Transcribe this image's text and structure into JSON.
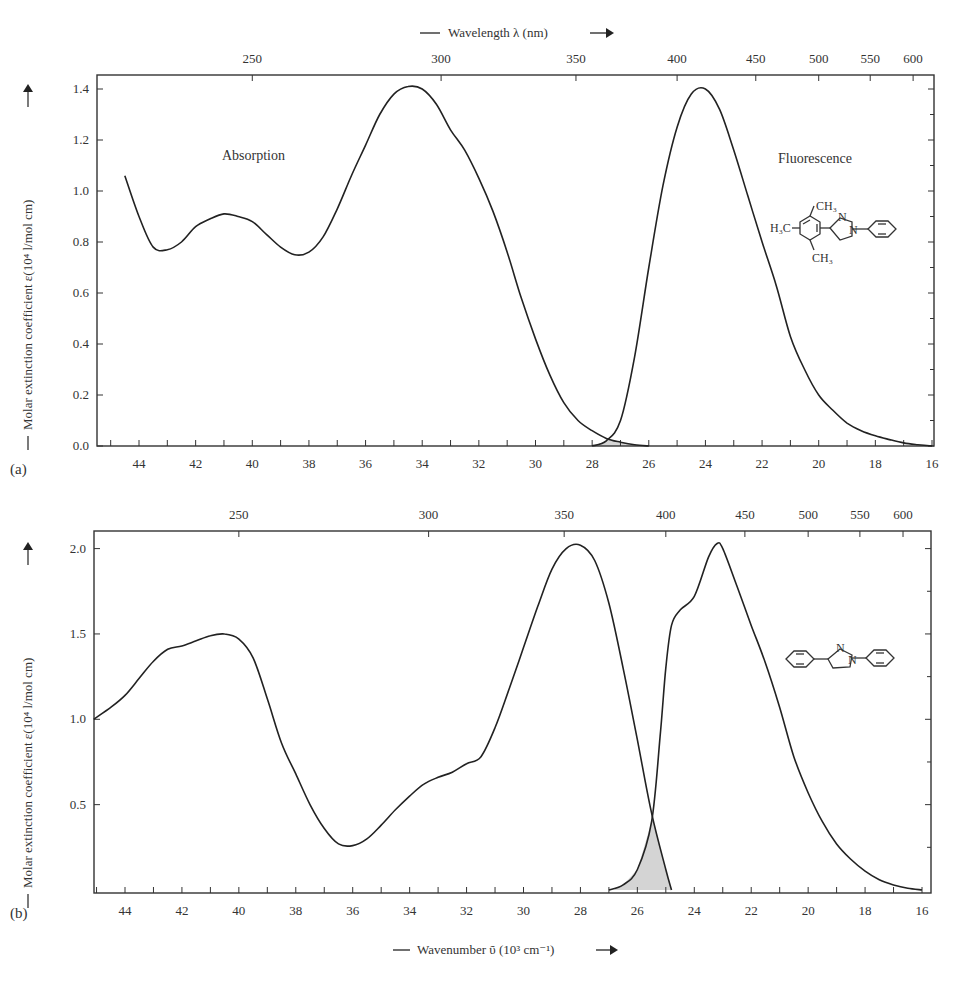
{
  "top_axis_title": "Wavelength λ (nm)",
  "bottom_axis_title": "Wavenumber ῦ (10³ cm⁻¹)",
  "y_axis_title": "Molar extinction coefficient ε(10⁴ l/mol cm)",
  "panels": {
    "a": {
      "label": "(a)",
      "absorption_label": "Absorption",
      "fluorescence_label": "Fluorescence",
      "molecule": {
        "substituents": [
          "CH₃",
          "H₃C",
          "CH₃"
        ],
        "atoms": [
          "N",
          "N"
        ]
      }
    },
    "b": {
      "label": "(b)",
      "molecule": {
        "atoms": [
          "N",
          "N"
        ]
      }
    }
  },
  "colors": {
    "curve": "#222222",
    "overlap_fill": "#d4d4d4",
    "frame": "#333333"
  },
  "chart_data": [
    {
      "type": "line",
      "title": "(a)",
      "xlabel": "Wavenumber ῦ (10³ cm⁻¹)",
      "x2label": "Wavelength λ (nm)",
      "ylabel": "Molar extinction coefficient ε(10⁴ l/mol cm)",
      "xlim": [
        45.5,
        15.9
      ],
      "ylim": [
        0,
        1.45
      ],
      "x_ticks": [
        44,
        42,
        40,
        38,
        36,
        34,
        32,
        30,
        28,
        26,
        24,
        22,
        20,
        18,
        16
      ],
      "y_ticks": [
        0.0,
        0.2,
        0.4,
        0.6,
        0.8,
        1.0,
        1.2,
        1.4
      ],
      "y_tick_labels": [
        "0.0",
        "0.2",
        "0.4",
        "0.6",
        "0.8",
        "1.0",
        "1.2",
        "1.4"
      ],
      "x2_ticks_nm": [
        250,
        300,
        350,
        400,
        450,
        500,
        550,
        600
      ],
      "grid": false,
      "annotations": [
        "Absorption",
        "Fluorescence"
      ],
      "series": [
        {
          "name": "Absorption",
          "x": [
            44.5,
            44.0,
            43.5,
            43.0,
            42.5,
            42.0,
            41.5,
            41.0,
            40.5,
            40.0,
            39.5,
            39.0,
            38.5,
            38.0,
            37.5,
            37.0,
            36.5,
            36.0,
            35.5,
            35.0,
            34.5,
            34.0,
            33.5,
            33.0,
            32.5,
            32.0,
            31.5,
            31.0,
            30.5,
            30.0,
            29.5,
            29.0,
            28.5,
            28.0,
            27.5,
            27.0,
            26.5,
            26.0
          ],
          "values": [
            1.06,
            0.9,
            0.78,
            0.77,
            0.8,
            0.86,
            0.89,
            0.91,
            0.9,
            0.88,
            0.83,
            0.78,
            0.75,
            0.76,
            0.82,
            0.93,
            1.06,
            1.18,
            1.3,
            1.38,
            1.41,
            1.4,
            1.34,
            1.24,
            1.16,
            1.05,
            0.92,
            0.76,
            0.58,
            0.42,
            0.28,
            0.17,
            0.1,
            0.06,
            0.03,
            0.015,
            0.005,
            0.0
          ]
        },
        {
          "name": "Fluorescence",
          "x": [
            28.0,
            27.5,
            27.0,
            26.5,
            26.0,
            25.5,
            25.0,
            24.5,
            24.0,
            23.5,
            23.0,
            22.5,
            22.0,
            21.5,
            21.0,
            20.5,
            20.0,
            19.5,
            19.0,
            18.5,
            18.0,
            17.5,
            17.0,
            16.5,
            16.0
          ],
          "values": [
            0.0,
            0.02,
            0.1,
            0.35,
            0.7,
            1.02,
            1.25,
            1.38,
            1.4,
            1.32,
            1.16,
            0.98,
            0.8,
            0.63,
            0.43,
            0.3,
            0.2,
            0.14,
            0.09,
            0.06,
            0.04,
            0.025,
            0.012,
            0.005,
            0.0
          ]
        }
      ],
      "overlap_region": {
        "x_range": [
          28.0,
          26.0
        ],
        "shaded": true
      }
    },
    {
      "type": "line",
      "title": "(b)",
      "xlabel": "Wavenumber ῦ (10³ cm⁻¹)",
      "x2label": "Wavelength λ (nm)",
      "ylabel": "Molar extinction coefficient ε(10⁴ l/mol cm)",
      "xlim": [
        45.1,
        15.7
      ],
      "ylim": [
        0,
        2.1
      ],
      "x_ticks": [
        44,
        42,
        40,
        38,
        36,
        34,
        32,
        30,
        28,
        26,
        24,
        22,
        20,
        18,
        16
      ],
      "y_ticks": [
        0.5,
        1.0,
        1.5,
        2.0
      ],
      "y_tick_labels": [
        "0.5",
        "1.0",
        "1.5",
        "2.0"
      ],
      "x2_ticks_nm": [
        250,
        300,
        350,
        400,
        450,
        500,
        550,
        600
      ],
      "grid": false,
      "series": [
        {
          "name": "Absorption",
          "x": [
            45.1,
            44.5,
            44.0,
            43.5,
            43.0,
            42.5,
            42.0,
            41.5,
            41.0,
            40.5,
            40.0,
            39.5,
            39.0,
            38.5,
            38.0,
            37.5,
            37.0,
            36.5,
            36.0,
            35.5,
            35.0,
            34.5,
            34.0,
            33.5,
            33.0,
            32.5,
            32.0,
            31.5,
            31.0,
            30.5,
            30.0,
            29.5,
            29.0,
            28.5,
            28.0,
            27.5,
            27.0,
            26.5,
            26.0,
            25.5,
            25.0,
            24.8
          ],
          "values": [
            1.0,
            1.07,
            1.14,
            1.24,
            1.34,
            1.41,
            1.43,
            1.46,
            1.49,
            1.5,
            1.47,
            1.36,
            1.12,
            0.86,
            0.68,
            0.5,
            0.36,
            0.27,
            0.26,
            0.3,
            0.38,
            0.47,
            0.55,
            0.62,
            0.66,
            0.69,
            0.74,
            0.78,
            0.95,
            1.18,
            1.42,
            1.66,
            1.88,
            2.0,
            2.02,
            1.93,
            1.68,
            1.3,
            0.88,
            0.45,
            0.12,
            0.0
          ]
        },
        {
          "name": "Fluorescence",
          "x": [
            27.0,
            26.5,
            26.0,
            25.5,
            25.2,
            25.0,
            24.8,
            24.5,
            24.0,
            23.5,
            23.2,
            23.0,
            22.5,
            22.0,
            21.5,
            21.0,
            20.5,
            20.0,
            19.5,
            19.0,
            18.5,
            18.0,
            17.5,
            17.0,
            16.5,
            16.0
          ],
          "values": [
            0.0,
            0.03,
            0.12,
            0.4,
            0.9,
            1.3,
            1.55,
            1.64,
            1.72,
            1.95,
            2.03,
            2.0,
            1.78,
            1.55,
            1.33,
            1.07,
            0.78,
            0.57,
            0.4,
            0.27,
            0.18,
            0.11,
            0.06,
            0.03,
            0.01,
            0.0
          ]
        }
      ],
      "overlap_region": {
        "x_range": [
          26.8,
          24.8
        ],
        "peak": 0.45,
        "shaded": true
      }
    }
  ]
}
